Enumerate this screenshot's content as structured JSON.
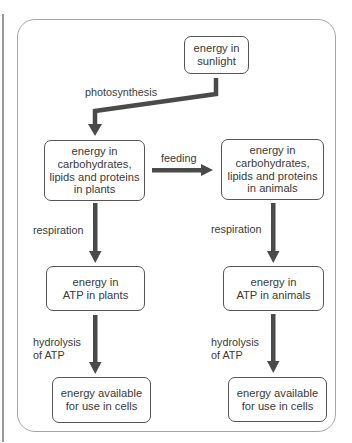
{
  "diagram": {
    "type": "energy-flow",
    "nodes": {
      "sunlight": "energy in\nsunlight",
      "plants_biomass": "energy in\ncarbohydrates,\nlipids and proteins\nin plants",
      "animals_biomass": "energy in\ncarbohydrates,\nlipids and proteins\nin animals",
      "plants_atp": "energy in\nATP in plants",
      "animals_atp": "energy in\nATP in animals",
      "plants_cells": "energy available\nfor use in cells",
      "animals_cells": "energy available\nfor use in cells"
    },
    "edges": {
      "photosynthesis": "photosynthesis",
      "feeding": "feeding",
      "respiration_plants": "respiration",
      "respiration_animals": "respiration",
      "hydrolysis_plants": "hydrolysis\nof ATP",
      "hydrolysis_animals": "hydrolysis\nof ATP"
    },
    "colors": {
      "arrow": "#4a4a4a",
      "box_border": "#555555",
      "frame_border": "#a6a6a6",
      "text": "#3a3a3a"
    }
  }
}
